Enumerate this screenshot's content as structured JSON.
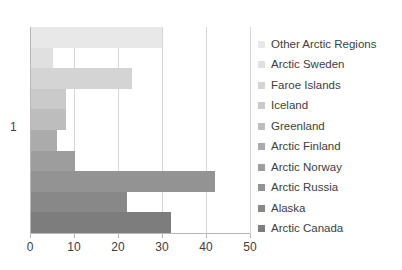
{
  "chart_data": {
    "type": "bar",
    "orientation": "horizontal",
    "title": "",
    "xlabel": "",
    "ylabel": "",
    "categories": [
      "1"
    ],
    "xlim": [
      0,
      50
    ],
    "xticks": [
      0,
      10,
      20,
      30,
      40,
      50
    ],
    "xtick_labels": [
      "0",
      "10",
      "20",
      "30",
      "40",
      "50"
    ],
    "grid": true,
    "legend_position": "right",
    "series": [
      {
        "name": "Other Arctic Regions",
        "values": [
          30
        ],
        "color": "#e8e8e8"
      },
      {
        "name": "Arctic Sweden",
        "values": [
          5
        ],
        "color": "#e0e0e0"
      },
      {
        "name": "Faroe Islands",
        "values": [
          23
        ],
        "color": "#d4d4d4"
      },
      {
        "name": "Iceland",
        "values": [
          8
        ],
        "color": "#cacaca"
      },
      {
        "name": "Greenland",
        "values": [
          8
        ],
        "color": "#bdbdbd"
      },
      {
        "name": "Arctic Finland",
        "values": [
          6
        ],
        "color": "#ababab"
      },
      {
        "name": "Arctic Norway",
        "values": [
          10
        ],
        "color": "#9d9d9d"
      },
      {
        "name": "Arctic Russia",
        "values": [
          42
        ],
        "color": "#939393"
      },
      {
        "name": "Alaska",
        "values": [
          22
        ],
        "color": "#888888"
      },
      {
        "name": "Arctic Canada",
        "values": [
          32
        ],
        "color": "#7d7d7d"
      }
    ]
  },
  "legend": {
    "items": [
      {
        "label": "Other Arctic Regions",
        "color": "#e8e8e8"
      },
      {
        "label": "Arctic Sweden",
        "color": "#e0e0e0"
      },
      {
        "label": "Faroe Islands",
        "color": "#d4d4d4"
      },
      {
        "label": "Iceland",
        "color": "#cacaca"
      },
      {
        "label": "Greenland",
        "color": "#bdbdbd"
      },
      {
        "label": "Arctic Finland",
        "color": "#ababab"
      },
      {
        "label": "Arctic Norway",
        "color": "#9d9d9d"
      },
      {
        "label": "Arctic Russia",
        "color": "#939393"
      },
      {
        "label": "Alaska",
        "color": "#888888"
      },
      {
        "label": "Arctic Canada",
        "color": "#7d7d7d"
      }
    ]
  },
  "axis": {
    "category_label": "1",
    "grid_color": "#d6d6d6",
    "axis_color": "#b8b8b8",
    "text_color": "#404040"
  }
}
